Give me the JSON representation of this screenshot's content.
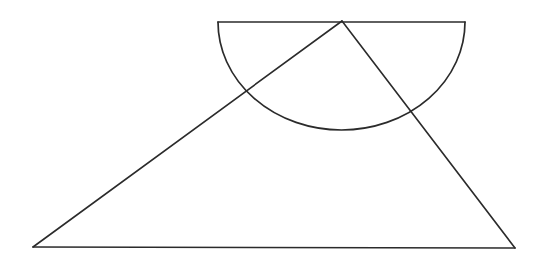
{
  "figure": {
    "background_color": "#ffffff",
    "stroke_color": "#2b2b2b",
    "stroke_width": 1.6,
    "canvas": {
      "width": 542,
      "height": 264
    }
  },
  "geometry": {
    "triangle": {
      "name": "outer-triangle",
      "apex": {
        "label": "A",
        "x": 342,
        "y": 21
      },
      "bottom_left": {
        "label": "B",
        "x": 33,
        "y": 247
      },
      "bottom_right": {
        "label": "C",
        "x": 515,
        "y": 248
      },
      "path": "M 342 21 L 33 247 L 515 248 Z"
    },
    "semicircle": {
      "name": "semicircular-arc",
      "chord_left": {
        "label": "D",
        "x": 218,
        "y": 22
      },
      "chord_right": {
        "label": "E",
        "x": 465,
        "y": 22
      },
      "center": {
        "x": 341.5,
        "y": 22
      },
      "radius_x": 123.5,
      "radius_y": 108,
      "lowest_point": {
        "x": 341.5,
        "y": 130
      },
      "orientation": "downward",
      "arc_path": "M 218 22 A 123.5 108 0 0 0 465 22",
      "chord_path": "M 218 22 L 465 22"
    },
    "intersections": [
      {
        "name": "left-intersection",
        "label": "P",
        "x": 245,
        "y": 93
      },
      {
        "name": "right-intersection",
        "label": "Q",
        "x": 412,
        "y": 110
      }
    ],
    "segments": [
      {
        "name": "triangle-left-side",
        "from": "A",
        "to": "B",
        "path": "M 342 21 L 33 247"
      },
      {
        "name": "triangle-right-side",
        "from": "A",
        "to": "C",
        "path": "M 342 21 L 515 248"
      },
      {
        "name": "triangle-base",
        "from": "B",
        "to": "C",
        "path": "M 33 247 L 515 248"
      }
    ]
  },
  "chart_data": {
    "type": "diagram",
    "xlabel": "",
    "ylabel": "",
    "xlim": [
      0,
      542
    ],
    "ylim": [
      264,
      0
    ],
    "grid": false,
    "legend": "none",
    "shapes": [
      {
        "kind": "polygon",
        "name": "outer-triangle",
        "closed": true,
        "points": [
          [
            342,
            21
          ],
          [
            33,
            247
          ],
          [
            515,
            248
          ]
        ],
        "fill": "none",
        "stroke": "#2b2b2b"
      },
      {
        "kind": "line",
        "name": "semicircle-diameter",
        "points": [
          [
            218,
            22
          ],
          [
            465,
            22
          ]
        ],
        "stroke": "#2b2b2b"
      },
      {
        "kind": "arc",
        "name": "semicircle-arc",
        "center": [
          341.5,
          22
        ],
        "rx": 123.5,
        "ry": 108,
        "start_angle_deg": 0,
        "end_angle_deg": 180,
        "sweep": "downward",
        "stroke": "#2b2b2b"
      }
    ],
    "annotations": [
      {
        "name": "left-intersection",
        "x": 245,
        "y": 93,
        "text": ""
      },
      {
        "name": "right-intersection",
        "x": 412,
        "y": 110,
        "text": ""
      },
      {
        "name": "apex-on-diameter",
        "x": 342,
        "y": 21,
        "text": ""
      }
    ]
  }
}
